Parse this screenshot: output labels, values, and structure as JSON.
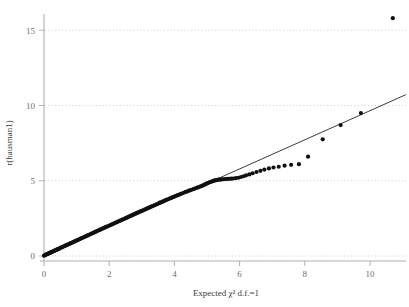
{
  "chart_data": {
    "type": "scatter",
    "title": "",
    "subtitle": "",
    "xlabel": "Expected χ² d.f.=1",
    "ylabel": "r(hausman1)",
    "xlim": [
      0,
      11.1
    ],
    "ylim": [
      0,
      16.2
    ],
    "xticks": [
      0,
      2,
      4,
      6,
      8,
      10
    ],
    "xtick_labels": [
      "0",
      "2",
      "4",
      "6",
      "8",
      "10"
    ],
    "yticks": [
      0,
      5,
      10,
      15
    ],
    "ytick_labels": [
      "0",
      "5",
      "10",
      "15"
    ],
    "grid": "horizontal-dotted",
    "grid_color": "#c8c8c8",
    "axis_color": "#b0b0b0",
    "point_color": "#101010",
    "line_color": "#1a1a1a",
    "point_size": 2.1,
    "legend": "none",
    "series": [
      {
        "name": "quantiles",
        "marker": "filled-circle",
        "points": [
          [
            0.0,
            0.02
          ],
          [
            0.03,
            0.05
          ],
          [
            0.05,
            0.08
          ],
          [
            0.07,
            0.1
          ],
          [
            0.09,
            0.12
          ],
          [
            0.11,
            0.14
          ],
          [
            0.13,
            0.16
          ],
          [
            0.15,
            0.18
          ],
          [
            0.17,
            0.2
          ],
          [
            0.19,
            0.22
          ],
          [
            0.21,
            0.24
          ],
          [
            0.23,
            0.26
          ],
          [
            0.25,
            0.28
          ],
          [
            0.27,
            0.3
          ],
          [
            0.29,
            0.32
          ],
          [
            0.31,
            0.34
          ],
          [
            0.33,
            0.36
          ],
          [
            0.35,
            0.38
          ],
          [
            0.37,
            0.4
          ],
          [
            0.39,
            0.42
          ],
          [
            0.41,
            0.44
          ],
          [
            0.43,
            0.46
          ],
          [
            0.45,
            0.48
          ],
          [
            0.47,
            0.5
          ],
          [
            0.49,
            0.52
          ],
          [
            0.52,
            0.55
          ],
          [
            0.55,
            0.58
          ],
          [
            0.58,
            0.61
          ],
          [
            0.61,
            0.64
          ],
          [
            0.64,
            0.67
          ],
          [
            0.67,
            0.7
          ],
          [
            0.7,
            0.73
          ],
          [
            0.73,
            0.76
          ],
          [
            0.76,
            0.79
          ],
          [
            0.79,
            0.82
          ],
          [
            0.82,
            0.85
          ],
          [
            0.85,
            0.88
          ],
          [
            0.88,
            0.91
          ],
          [
            0.91,
            0.94
          ],
          [
            0.94,
            0.97
          ],
          [
            0.97,
            1.0
          ],
          [
            1.0,
            1.03
          ],
          [
            1.04,
            1.07
          ],
          [
            1.08,
            1.11
          ],
          [
            1.12,
            1.15
          ],
          [
            1.16,
            1.19
          ],
          [
            1.2,
            1.23
          ],
          [
            1.24,
            1.27
          ],
          [
            1.28,
            1.31
          ],
          [
            1.32,
            1.35
          ],
          [
            1.36,
            1.39
          ],
          [
            1.4,
            1.43
          ],
          [
            1.44,
            1.47
          ],
          [
            1.48,
            1.51
          ],
          [
            1.52,
            1.55
          ],
          [
            1.56,
            1.59
          ],
          [
            1.6,
            1.63
          ],
          [
            1.64,
            1.67
          ],
          [
            1.68,
            1.71
          ],
          [
            1.72,
            1.75
          ],
          [
            1.76,
            1.79
          ],
          [
            1.8,
            1.83
          ],
          [
            1.85,
            1.88
          ],
          [
            1.9,
            1.93
          ],
          [
            1.95,
            1.97
          ],
          [
            2.0,
            2.02
          ],
          [
            2.05,
            2.07
          ],
          [
            2.1,
            2.12
          ],
          [
            2.15,
            2.17
          ],
          [
            2.2,
            2.22
          ],
          [
            2.25,
            2.27
          ],
          [
            2.3,
            2.32
          ],
          [
            2.35,
            2.37
          ],
          [
            2.4,
            2.42
          ],
          [
            2.45,
            2.46
          ],
          [
            2.5,
            2.51
          ],
          [
            2.55,
            2.56
          ],
          [
            2.6,
            2.61
          ],
          [
            2.65,
            2.66
          ],
          [
            2.7,
            2.71
          ],
          [
            2.75,
            2.76
          ],
          [
            2.8,
            2.81
          ],
          [
            2.85,
            2.86
          ],
          [
            2.9,
            2.91
          ],
          [
            2.95,
            2.96
          ],
          [
            3.0,
            3.0
          ],
          [
            3.05,
            3.05
          ],
          [
            3.1,
            3.1
          ],
          [
            3.15,
            3.15
          ],
          [
            3.2,
            3.2
          ],
          [
            3.25,
            3.25
          ],
          [
            3.3,
            3.3
          ],
          [
            3.35,
            3.34
          ],
          [
            3.4,
            3.39
          ],
          [
            3.45,
            3.44
          ],
          [
            3.5,
            3.49
          ],
          [
            3.55,
            3.54
          ],
          [
            3.6,
            3.58
          ],
          [
            3.65,
            3.63
          ],
          [
            3.7,
            3.68
          ],
          [
            3.75,
            3.73
          ],
          [
            3.8,
            3.77
          ],
          [
            3.85,
            3.82
          ],
          [
            3.9,
            3.86
          ],
          [
            3.95,
            3.91
          ],
          [
            4.0,
            3.95
          ],
          [
            4.05,
            4.0
          ],
          [
            4.1,
            4.04
          ],
          [
            4.15,
            4.08
          ],
          [
            4.2,
            4.13
          ],
          [
            4.25,
            4.17
          ],
          [
            4.3,
            4.22
          ],
          [
            4.35,
            4.26
          ],
          [
            4.4,
            4.3
          ],
          [
            4.45,
            4.34
          ],
          [
            4.5,
            4.38
          ],
          [
            4.55,
            4.42
          ],
          [
            4.6,
            4.46
          ],
          [
            4.65,
            4.5
          ],
          [
            4.7,
            4.54
          ],
          [
            4.75,
            4.58
          ],
          [
            4.8,
            4.62
          ],
          [
            4.85,
            4.66
          ],
          [
            4.88,
            4.7
          ],
          [
            4.92,
            4.74
          ],
          [
            4.96,
            4.78
          ],
          [
            5.0,
            4.82
          ],
          [
            5.04,
            4.86
          ],
          [
            5.08,
            4.9
          ],
          [
            5.12,
            4.93
          ],
          [
            5.16,
            4.96
          ],
          [
            5.2,
            4.99
          ],
          [
            5.24,
            5.02
          ],
          [
            5.28,
            5.04
          ],
          [
            5.32,
            5.06
          ],
          [
            5.36,
            5.07
          ],
          [
            5.4,
            5.08
          ],
          [
            5.45,
            5.09
          ],
          [
            5.5,
            5.1
          ],
          [
            5.56,
            5.11
          ],
          [
            5.62,
            5.12
          ],
          [
            5.68,
            5.13
          ],
          [
            5.74,
            5.14
          ],
          [
            5.8,
            5.15
          ],
          [
            5.88,
            5.17
          ],
          [
            5.96,
            5.2
          ],
          [
            6.04,
            5.25
          ],
          [
            6.12,
            5.3
          ],
          [
            6.2,
            5.36
          ],
          [
            6.3,
            5.42
          ],
          [
            6.4,
            5.5
          ],
          [
            6.52,
            5.58
          ],
          [
            6.64,
            5.66
          ],
          [
            6.76,
            5.74
          ],
          [
            6.9,
            5.82
          ],
          [
            7.04,
            5.88
          ],
          [
            7.2,
            5.93
          ],
          [
            7.38,
            6.0
          ],
          [
            7.58,
            6.06
          ],
          [
            7.82,
            6.1
          ],
          [
            8.1,
            6.6
          ],
          [
            8.55,
            7.75
          ],
          [
            9.1,
            8.7
          ],
          [
            9.72,
            9.5
          ],
          [
            10.7,
            15.8
          ]
        ]
      }
    ],
    "reference_line": {
      "name": "identity-line",
      "x0": 0.02,
      "y0": 0.0,
      "x1": 11.1,
      "y1": 10.72
    }
  }
}
